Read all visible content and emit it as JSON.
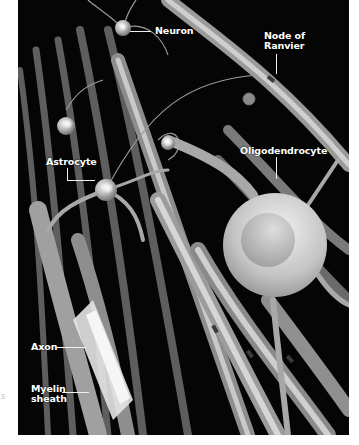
{
  "figure": {
    "background_color": "#050505",
    "label_color": "#ffffff",
    "labels": [
      {
        "id": "neuron",
        "text": "Neuron"
      },
      {
        "id": "node-of-ranvier",
        "lines": [
          "Node of",
          "Ranvier"
        ]
      },
      {
        "id": "astrocyte",
        "text": "Astrocyte"
      },
      {
        "id": "oligodendrocyte",
        "text": "Oligodendrocyte"
      },
      {
        "id": "axon",
        "text": "Axon"
      },
      {
        "id": "myelin-sheath",
        "lines": [
          "Myelin",
          "sheath"
        ]
      }
    ]
  },
  "margin_mark": "s"
}
